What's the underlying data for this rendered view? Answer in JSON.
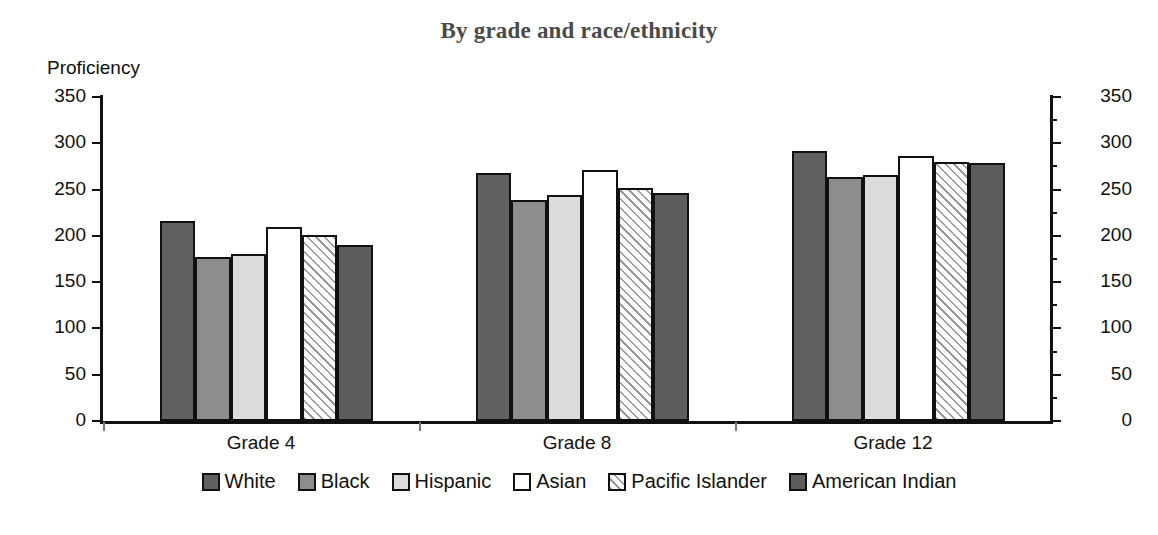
{
  "chart_data": {
    "type": "bar",
    "title": "By grade and race/ethnicity",
    "ylabel": "Proficiency",
    "xlabel": "",
    "ylim": [
      0,
      350
    ],
    "ytick_step": 50,
    "yticks": [
      0,
      50,
      100,
      150,
      200,
      250,
      300,
      350
    ],
    "grid": false,
    "legend_position": "bottom",
    "dual_axis": true,
    "categories": [
      "Grade 4",
      "Grade 8",
      "Grade 12"
    ],
    "series": [
      {
        "name": "White",
        "fill": "solid-dark-gray",
        "color": "#616161",
        "values": [
          216,
          268,
          292
        ]
      },
      {
        "name": "Black",
        "fill": "solid-mid-gray",
        "color": "#8d8d8d",
        "values": [
          177,
          239,
          264
        ]
      },
      {
        "name": "Hispanic",
        "fill": "solid-light-gray",
        "color": "#dcdcdc",
        "values": [
          180,
          244,
          266
        ]
      },
      {
        "name": "Asian",
        "fill": "solid-white",
        "color": "#ffffff",
        "values": [
          210,
          271,
          286
        ]
      },
      {
        "name": "Pacific Islander",
        "fill": "diagonal-hatch",
        "color": "#ffffff",
        "values": [
          201,
          252,
          280
        ]
      },
      {
        "name": "American Indian",
        "fill": "solid-dark-gray-2",
        "color": "#5d5d5d",
        "values": [
          190,
          246,
          279
        ]
      }
    ]
  },
  "axis": {
    "left_ticks": [
      "350",
      "300",
      "250",
      "200",
      "150",
      "100",
      "50",
      "0"
    ],
    "right_ticks": [
      "350",
      "300",
      "250",
      "200",
      "150",
      "100",
      "50",
      "0"
    ]
  },
  "legend": {
    "items": [
      {
        "label": "White"
      },
      {
        "label": "Black"
      },
      {
        "label": "Hispanic"
      },
      {
        "label": "Asian"
      },
      {
        "label": "Pacific Islander"
      },
      {
        "label": "American Indian"
      }
    ]
  }
}
